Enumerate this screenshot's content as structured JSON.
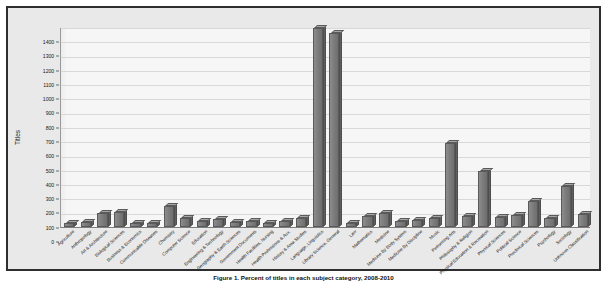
{
  "figure": {
    "caption": "Figure 1. Percent of titles in each subject category, 2008-2010"
  },
  "chart_data": {
    "type": "bar",
    "title": "",
    "xlabel": "",
    "ylabel": "Titles",
    "ylim": [
      0,
      1400
    ],
    "ytick_step": 100,
    "grid": true,
    "legend": "none",
    "style": "3d-column",
    "bar_color": "#7a7a7a",
    "plot_background": "#f4f4f4",
    "panel_background": "#e9e9e9",
    "border_color": "#2e2e2e",
    "ytick_labels": [
      "0",
      "100",
      "200",
      "300",
      "400",
      "500",
      "600",
      "700",
      "800",
      "900",
      "1000",
      "1100",
      "1200",
      "1300",
      "1400"
    ],
    "categories": [
      "Agriculture",
      "Anthropology",
      "Art & Architecture",
      "Biological Sciences",
      "Business & Economics",
      "Communicable Diseases",
      "Chemistry",
      "Computer Science",
      "Education",
      "Engineering & Technology",
      "Geography & Earth Sciences",
      "Government Documents",
      "Health Facilities, Nursing",
      "Health Professions & Aux.",
      "History & Area Studies",
      "Language, Linguistics",
      "Library Science, General",
      "Law",
      "Mathematics",
      "Medicine",
      "Medicine By Body System",
      "Medicine By Discipline",
      "Music",
      "Performing Arts",
      "Philosophy & Religion",
      "Physical Education & Recreation",
      "Physical Sciences",
      "Political Science",
      "Preclinical Sciences",
      "Psychology",
      "Sociology",
      "Unknown Classification"
    ],
    "values": [
      30,
      35,
      95,
      105,
      30,
      25,
      150,
      60,
      40,
      55,
      35,
      45,
      30,
      45,
      60,
      1390,
      1360,
      30,
      75,
      95,
      45,
      50,
      65,
      590,
      75,
      390,
      70,
      85,
      180,
      60,
      290,
      90
    ]
  }
}
